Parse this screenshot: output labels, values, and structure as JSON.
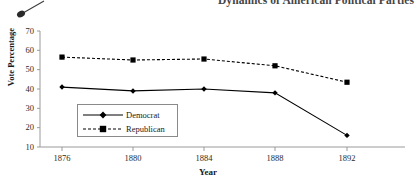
{
  "document": {
    "running_header": "Dynamics of American Political Parties"
  },
  "artifact": {
    "name": "pen-mark",
    "description": "diagonal scan artifact"
  },
  "chart_data": {
    "type": "line",
    "title": "",
    "xlabel": "Year",
    "ylabel": "Vote Percentage",
    "categories": [
      "1876",
      "1880",
      "1884",
      "1888",
      "1892"
    ],
    "x": [
      1876,
      1880,
      1884,
      1888,
      1892
    ],
    "ylim": [
      10,
      70
    ],
    "yticks": [
      "10",
      "20",
      "30",
      "40",
      "50",
      "60",
      "70"
    ],
    "ytick_values": [
      10,
      20,
      30,
      40,
      50,
      60,
      70
    ],
    "grid": false,
    "legend_position": "inside-lower-left",
    "series": [
      {
        "name": "Democrat",
        "values": [
          41,
          39,
          40,
          38,
          16
        ],
        "color": "#000000",
        "line_style": "solid",
        "marker": "diamond"
      },
      {
        "name": "Republican",
        "values": [
          56.5,
          55,
          55.5,
          52,
          43.5
        ],
        "color": "#000000",
        "line_style": "dashed",
        "marker": "square"
      }
    ]
  }
}
